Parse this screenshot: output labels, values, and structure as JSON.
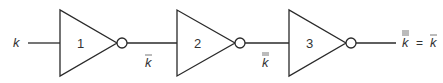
{
  "diagram": {
    "type": "logic-circuit",
    "input": {
      "label": "k",
      "overbars": 0
    },
    "gates": [
      {
        "id": "1",
        "type": "NOT",
        "output": {
          "label": "k",
          "overbars": 1
        }
      },
      {
        "id": "2",
        "type": "NOT",
        "output": {
          "label": "k",
          "overbars": 2
        }
      },
      {
        "id": "3",
        "type": "NOT",
        "output": {
          "label": "k",
          "overbars": 3,
          "equals": "=",
          "simplified": {
            "label": "k",
            "overbars": 1
          }
        }
      }
    ],
    "colors": {
      "stroke": "#2a2a2a",
      "text": "#333333",
      "background": "#ffffff"
    }
  }
}
